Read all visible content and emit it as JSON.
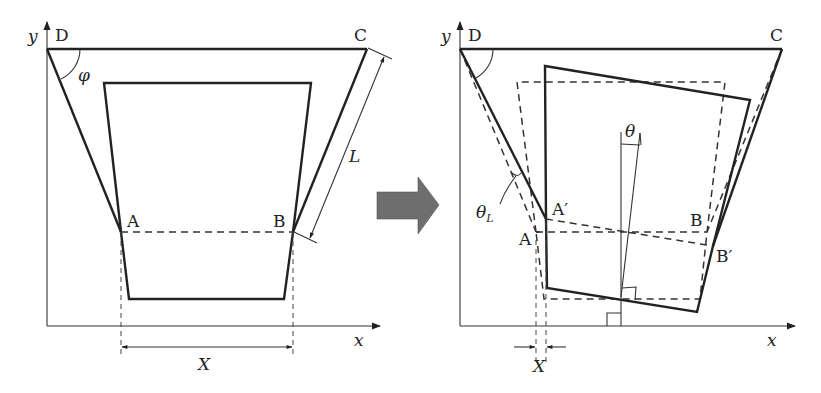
{
  "figure": {
    "arrow_color": "#6e6e6e",
    "line_color": "#222222",
    "left_panel": {
      "axis_x_label": "x",
      "axis_y_label": "y",
      "points": {
        "D": "D",
        "C": "C",
        "A": "A",
        "B": "B"
      },
      "angle_label": "φ",
      "length_label": "L",
      "width_label": "X"
    },
    "right_panel": {
      "axis_x_label": "x",
      "axis_y_label": "y",
      "points": {
        "D": "D",
        "C": "C",
        "A": "A",
        "B": "B",
        "A_prime": "A′",
        "B_prime": "B′"
      },
      "tilt_angle_label": "θ",
      "link_angle_label": "θ",
      "link_angle_subscript": "L",
      "width_label": "X"
    }
  }
}
